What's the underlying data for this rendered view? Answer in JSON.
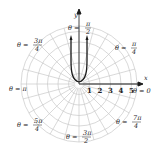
{
  "diagram": {
    "type": "polar-plot",
    "axes": {
      "x_label": "x",
      "y_label": "y"
    },
    "radial_ticks": [
      "1",
      "2",
      "3",
      "4",
      "5"
    ],
    "angle_labels": [
      {
        "id": "0",
        "eq": "θ =",
        "num": "0",
        "den": ""
      },
      {
        "id": "pi4",
        "eq": "θ =",
        "num": "π",
        "den": "4"
      },
      {
        "id": "pi2",
        "eq": "θ =",
        "num": "π",
        "den": "2"
      },
      {
        "id": "3pi4",
        "eq": "θ =",
        "num": "3π",
        "den": "4"
      },
      {
        "id": "pi",
        "eq": "θ = π",
        "num": "",
        "den": ""
      },
      {
        "id": "5pi4",
        "eq": "θ =",
        "num": "5π",
        "den": "4"
      },
      {
        "id": "3pi2",
        "eq": "θ =",
        "num": "3π",
        "den": "2"
      },
      {
        "id": "7pi4",
        "eq": "θ =",
        "num": "7π",
        "den": "4"
      }
    ],
    "colors": {
      "grid": "#c8c8c8",
      "curve": "#1a1a1a",
      "axis": "#1a1a1a",
      "text": "#222222"
    }
  }
}
